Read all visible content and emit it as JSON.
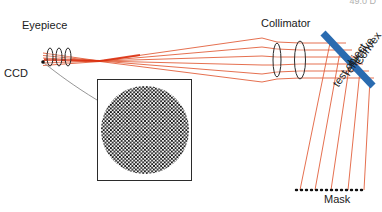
{
  "figure": {
    "type": "optical-ray-diagram",
    "title_fragment": "49.0 D",
    "background": "#ffffff"
  },
  "labels": {
    "eyepiece": "Eyepiece",
    "ccd": "CCD",
    "collimator": "Collimator",
    "mask": "Mask",
    "test_object_line1": "Convex",
    "test_object_line2": "reflective",
    "test_object_line3": "test object"
  },
  "colors": {
    "ray": "#e2603c",
    "ray_core": "#d92b0c",
    "test_object": "#2a6bb0",
    "outline": "#2b2b2b",
    "leader": "#8a8a8a",
    "checker_dark": "#101010",
    "checker_light": "#f2f2f2"
  },
  "components": {
    "ccd": {
      "name": "CCD detector point",
      "x": 43,
      "y": 62
    },
    "eyepiece_lenses": [
      {
        "cx": 50,
        "cy": 57,
        "rx": 3,
        "ry": 9
      },
      {
        "cx": 59,
        "cy": 57,
        "rx": 3,
        "ry": 9
      },
      {
        "cx": 68,
        "cy": 57,
        "rx": 3,
        "ry": 9
      }
    ],
    "collimator_lenses": [
      {
        "cx": 277,
        "cy": 60,
        "rx": 4,
        "ry": 17
      },
      {
        "cx": 300,
        "cy": 60,
        "rx": 5,
        "ry": 19
      }
    ],
    "test_object": {
      "name": "Convex reflective test object",
      "x1": 323,
      "y1": 34,
      "x2": 372,
      "y2": 85,
      "thickness": 7,
      "color": "#2a6bb0"
    },
    "mask": {
      "name": "Mask",
      "x1": 296,
      "y1": 190,
      "x2": 366,
      "y2": 190,
      "style": "dotted"
    },
    "inset": {
      "name": "CCD image detail",
      "x": 97,
      "y": 79,
      "width": 95,
      "height": 102,
      "content": "circular checkerboard test pattern"
    }
  },
  "ray_bundle": {
    "count": 5,
    "waist_x": 100,
    "description": "beam converges to waist after eyepiece, expands toward collimator, reflects from convex test object down through mask"
  }
}
